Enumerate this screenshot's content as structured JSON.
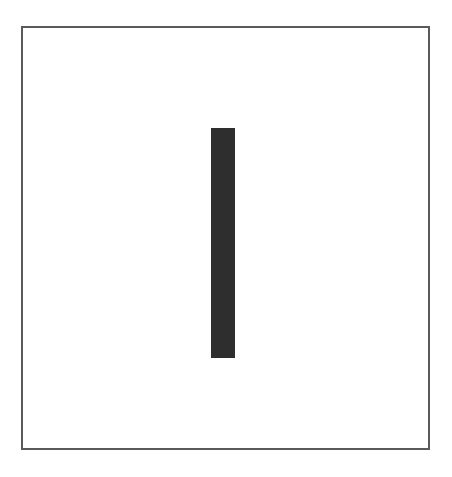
{
  "figure": {
    "frame": {
      "border_color": "#5a5a5a",
      "background": "#ffffff"
    },
    "shape": {
      "type": "vertical-bar",
      "color": "#2e2e2e",
      "left": 211,
      "top": 128,
      "width": 24,
      "height": 230
    }
  }
}
